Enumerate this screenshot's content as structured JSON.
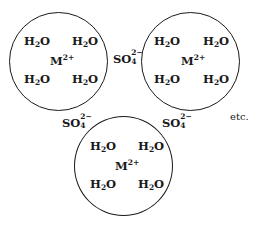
{
  "diagram": {
    "hydrated_ions": [
      {
        "id": "top-left",
        "center_label": {
          "base": "M",
          "charge": "2+"
        },
        "ligands": [
          {
            "base": "H",
            "sub": "2",
            "tail": "O"
          },
          {
            "base": "H",
            "sub": "2",
            "tail": "O"
          },
          {
            "base": "H",
            "sub": "2",
            "tail": "O"
          },
          {
            "base": "H",
            "sub": "2",
            "tail": "O"
          }
        ]
      },
      {
        "id": "top-right",
        "center_label": {
          "base": "M",
          "charge": "2+"
        },
        "ligands": [
          {
            "base": "H",
            "sub": "2",
            "tail": "O"
          },
          {
            "base": "H",
            "sub": "2",
            "tail": "O"
          },
          {
            "base": "H",
            "sub": "2",
            "tail": "O"
          },
          {
            "base": "H",
            "sub": "2",
            "tail": "O"
          }
        ]
      },
      {
        "id": "bottom",
        "center_label": {
          "base": "M",
          "charge": "2+"
        },
        "ligands": [
          {
            "base": "H",
            "sub": "2",
            "tail": "O"
          },
          {
            "base": "H",
            "sub": "2",
            "tail": "O"
          },
          {
            "base": "H",
            "sub": "2",
            "tail": "O"
          },
          {
            "base": "H",
            "sub": "2",
            "tail": "O"
          }
        ]
      }
    ],
    "counter_ions": [
      {
        "position": "between-top",
        "base": "SO",
        "sub": "4",
        "charge": "2−"
      },
      {
        "position": "lower-left",
        "base": "SO",
        "sub": "4",
        "charge": "2−"
      },
      {
        "position": "lower-right",
        "base": "SO",
        "sub": "4",
        "charge": "2−"
      }
    ],
    "continuation": "etc."
  }
}
